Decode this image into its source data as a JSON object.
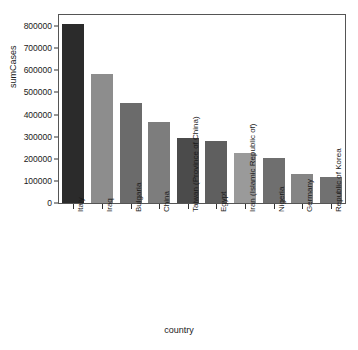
{
  "chart_data": {
    "type": "bar",
    "title": "",
    "xlabel": "country",
    "ylabel": "sumCases",
    "categories": [
      "Italy",
      "Iraq",
      "Bulgaria",
      "China",
      "Taiwan (Province of China)",
      "Egypt",
      "Iran (Islamic Republic of)",
      "Nigeria",
      "Germany",
      "Republic of Korea"
    ],
    "values": [
      808000,
      582000,
      450000,
      368000,
      295000,
      282000,
      225000,
      205000,
      133000,
      118000
    ],
    "bar_colors": [
      "#2b2b2b",
      "#8d8d8d",
      "#6b6b6b",
      "#7d7d7d",
      "#4b4b4b",
      "#5f5f5f",
      "#9a9a9a",
      "#6f6f6f",
      "#858585",
      "#717171"
    ],
    "ylim": [
      0,
      850000
    ],
    "yticks": [
      0,
      100000,
      200000,
      300000,
      400000,
      500000,
      600000,
      700000,
      800000
    ],
    "ytick_labels": [
      "0",
      "100000",
      "200000",
      "300000",
      "400000",
      "500000",
      "600000",
      "700000",
      "800000"
    ],
    "grid": false,
    "legend": false,
    "legend_position": "none",
    "axis_color": "#555555",
    "background_color": "#ffffff",
    "text_color": "#1a1a1a"
  }
}
